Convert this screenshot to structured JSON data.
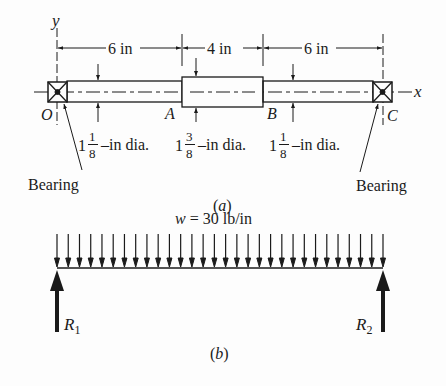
{
  "figure_a": {
    "caption": "(a)",
    "axes": {
      "y_label": "y",
      "x_label": "x"
    },
    "points": {
      "O": "O",
      "A": "A",
      "B": "B",
      "C": "C"
    },
    "dimensions": [
      {
        "label": "6 in",
        "from": "O",
        "to": "A"
      },
      {
        "label": "4 in",
        "from": "A",
        "to": "B"
      },
      {
        "label": "6 in",
        "from": "B",
        "to": "C"
      }
    ],
    "diameters": [
      {
        "whole": "1",
        "num": "1",
        "den": "8",
        "suffix": "–in dia.",
        "section": "OA"
      },
      {
        "whole": "1",
        "num": "3",
        "den": "8",
        "suffix": "–in dia.",
        "section": "AB"
      },
      {
        "whole": "1",
        "num": "1",
        "den": "8",
        "suffix": "–in dia.",
        "section": "BC"
      }
    ],
    "bearing_left_label": "Bearing",
    "bearing_right_label": "Bearing"
  },
  "figure_b": {
    "caption": "(b)",
    "load_label": "w = 30 lb/in",
    "load_symbol": "w",
    "load_value": "= 30 lb/in",
    "arrow_count": 30,
    "reactions": {
      "left_sym": "R",
      "left_sub": "1",
      "right_sym": "R",
      "right_sub": "2"
    }
  },
  "colors": {
    "ink": "#1a1a1a",
    "background": "#fdfdfd"
  }
}
